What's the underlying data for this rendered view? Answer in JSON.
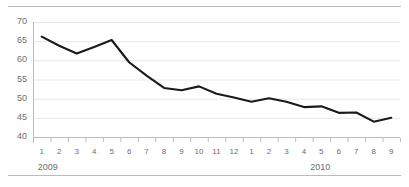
{
  "chart_data": {
    "type": "line",
    "title": "",
    "subtitle": "",
    "xlabel": "",
    "ylabel": "",
    "ylim": [
      40,
      70
    ],
    "yticks": [
      40,
      45,
      50,
      55,
      60,
      65,
      70
    ],
    "grid": true,
    "legend": null,
    "legend_position": "none",
    "line_color": "#1a1a1a",
    "grid_color": "#e6e7e8",
    "axis_color": "#babcbe",
    "x": [
      "1",
      "2",
      "3",
      "4",
      "5",
      "6",
      "7",
      "8",
      "9",
      "10",
      "11",
      "12",
      "1",
      "2",
      "3",
      "4",
      "5",
      "6",
      "7",
      "8",
      "9"
    ],
    "categories": [
      "1",
      "2",
      "3",
      "4",
      "5",
      "6",
      "7",
      "8",
      "9",
      "10",
      "11",
      "12",
      "1",
      "2",
      "3",
      "4",
      "5",
      "6",
      "7",
      "8",
      "9"
    ],
    "group_labels": [
      {
        "label": "2009",
        "start_index": 0,
        "end_index": 11
      },
      {
        "label": "2010",
        "start_index": 12,
        "end_index": 20
      }
    ],
    "series": [
      {
        "name": "",
        "values": [
          66.2,
          63.8,
          61.8,
          63.5,
          65.3,
          59.5,
          56.0,
          52.8,
          52.2,
          53.2,
          51.3,
          50.3,
          49.2,
          50.1,
          49.2,
          47.8,
          48.0,
          46.3,
          46.4,
          44.0,
          45.0
        ]
      }
    ],
    "values": [
      66.2,
      63.8,
      61.8,
      63.5,
      65.3,
      59.5,
      56.0,
      52.8,
      52.2,
      53.2,
      51.3,
      50.3,
      49.2,
      50.1,
      49.2,
      47.8,
      48.0,
      46.3,
      46.4,
      44.0,
      45.0
    ]
  },
  "figure": {
    "rules": [
      "top-rule",
      "bottom-rule"
    ]
  }
}
